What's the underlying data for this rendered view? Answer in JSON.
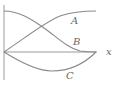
{
  "diagram": {
    "type": "function-curves",
    "axes": {
      "x_label": "x",
      "y_label": ""
    },
    "curves": [
      {
        "id": "A",
        "label": "A",
        "description": "rises from origin, concave down, levels off near top",
        "label_pos": [
          73,
          24
        ]
      },
      {
        "id": "B",
        "label": "B",
        "description": "starts at top of y-axis, decreases in cosine shape, meets x-axis at right end",
        "label_pos": [
          75,
          45
        ]
      },
      {
        "id": "C",
        "label": "C",
        "description": "starts at origin, dips below x-axis, returns to x-axis at right end",
        "label_pos": [
          68,
          78
        ]
      }
    ],
    "colors": {
      "axis": "#9a9a9a",
      "curve": "#8a8a8a",
      "label": "#666666"
    }
  }
}
